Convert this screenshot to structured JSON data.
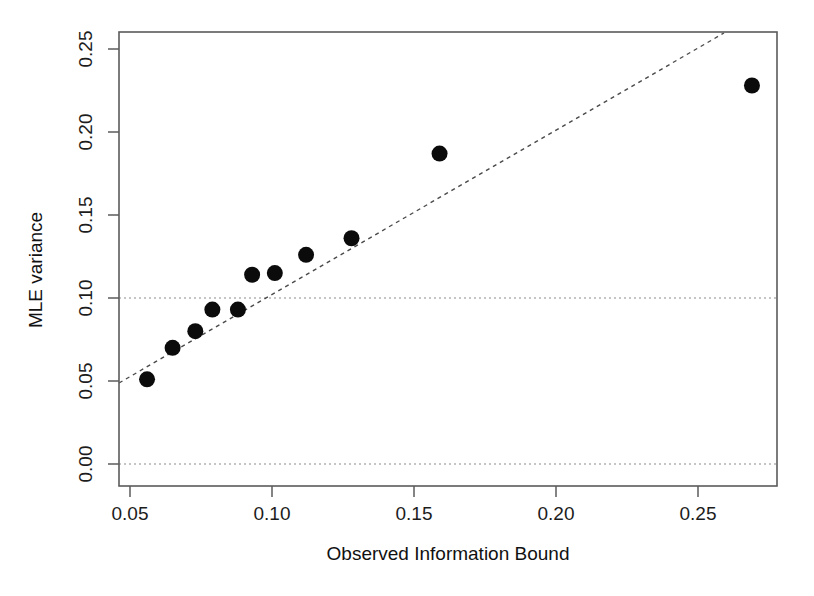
{
  "figure": {
    "background_color": "#ffffff",
    "point_color": "#0b0b0b",
    "axis_color": "#5b5b5b",
    "reference_line_color": "#8c8c8c",
    "identity_line_color": "#4a4a4a"
  },
  "axes": {
    "x_label": "Observed Information Bound",
    "y_label": "MLE variance",
    "x_ticks": [
      "0.05",
      "0.10",
      "0.15",
      "0.20",
      "0.25"
    ],
    "y_ticks": [
      "0.00",
      "0.05",
      "0.10",
      "0.15",
      "0.20",
      "0.25"
    ]
  },
  "chart_data": {
    "type": "scatter",
    "title": "",
    "subtitle": "",
    "xlabel": "Observed Information Bound",
    "ylabel": "MLE variance",
    "xlim": [
      0.0466,
      0.2785
    ],
    "ylim": [
      -0.0084,
      0.2608
    ],
    "xticks": [
      0.05,
      0.1,
      0.15,
      0.2,
      0.25
    ],
    "yticks": [
      0.0,
      0.05,
      0.1,
      0.15,
      0.2,
      0.25
    ],
    "xtick_labels": [
      "0.05",
      "0.10",
      "0.15",
      "0.20",
      "0.25"
    ],
    "ytick_labels": [
      "0.00",
      "0.05",
      "0.10",
      "0.15",
      "0.20",
      "0.25"
    ],
    "grid": false,
    "legend": null,
    "legend_position": "none",
    "series": [
      {
        "name": "MLE variance vs observed information bound",
        "marker": "filled-circle",
        "marker_color": "#0b0b0b",
        "marker_size": 8,
        "x": [
          0.056,
          0.065,
          0.073,
          0.079,
          0.088,
          0.093,
          0.101,
          0.112,
          0.128,
          0.159,
          0.269
        ],
        "y": [
          0.051,
          0.07,
          0.08,
          0.093,
          0.093,
          0.114,
          0.115,
          0.126,
          0.136,
          0.187,
          0.228
        ]
      }
    ],
    "annotations": [
      {
        "type": "line",
        "name": "identity-line",
        "style": "dashed",
        "color": "#4a4a4a",
        "x": [
          0.047,
          0.26
        ],
        "y": [
          0.047,
          0.26
        ],
        "description": "y = x reference line"
      },
      {
        "type": "hline",
        "name": "hline-0.10",
        "style": "dotted",
        "color": "#8c8c8c",
        "y": 0.1
      },
      {
        "type": "hline",
        "name": "hline-0.00",
        "style": "dotted",
        "color": "#8c8c8c",
        "y": 0.0
      }
    ]
  }
}
